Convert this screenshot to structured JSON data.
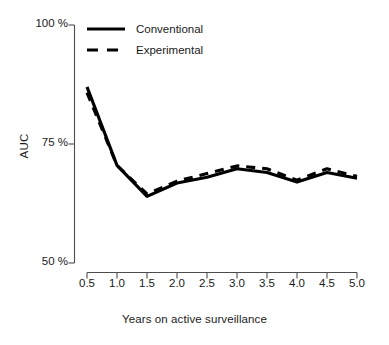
{
  "chart_data": {
    "type": "line",
    "title": "",
    "xlabel": "Years on active surveillance",
    "ylabel": "AUC",
    "x": [
      0.5,
      1.0,
      1.5,
      2.0,
      2.5,
      3.0,
      3.5,
      4.0,
      4.5,
      5.0
    ],
    "xlim": [
      0.5,
      5.0
    ],
    "ylim": [
      50,
      100
    ],
    "grid": false,
    "legend_position": "top-left",
    "xticks": [
      "0.5",
      "1.0",
      "1.5",
      "2.0",
      "2.5",
      "3.0",
      "3.5",
      "4.0",
      "4.5",
      "5.0"
    ],
    "yticks": [
      "50 %",
      "75 %",
      "100 %"
    ],
    "ytick_values": [
      50,
      75,
      100
    ],
    "series": [
      {
        "name": "Conventional",
        "style": "solid",
        "color": "#000000",
        "values": [
          87.0,
          70.5,
          64.0,
          66.8,
          68.0,
          69.8,
          69.0,
          67.0,
          69.0,
          67.8
        ]
      },
      {
        "name": "Experimental",
        "style": "dashed",
        "color": "#000000",
        "values": [
          85.8,
          70.5,
          64.5,
          67.2,
          68.8,
          70.4,
          69.8,
          67.4,
          69.8,
          68.2
        ]
      }
    ]
  },
  "legend": {
    "items": [
      {
        "label": "Conventional",
        "style": "solid"
      },
      {
        "label": "Experimental",
        "style": "dashed"
      }
    ]
  },
  "axes": {
    "y_title": "AUC",
    "x_title": "Years on active surveillance"
  }
}
